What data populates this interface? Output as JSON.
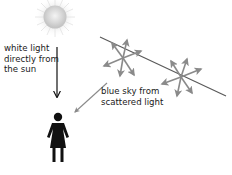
{
  "diagram": {
    "labels": {
      "direct_light": [
        "white light",
        "directly from",
        "the sun"
      ],
      "scattered_light": [
        "blue sky from",
        "scattered light"
      ]
    },
    "elements": {
      "sun": {
        "icon": "sun-icon",
        "cx": 55,
        "cy": 17,
        "r": 12
      },
      "direct_arrow": {
        "from": [
          57,
          47
        ],
        "to": [
          57,
          98
        ],
        "color": "#111111"
      },
      "incoming_ray": {
        "from": [
          100,
          37
        ],
        "to": [
          226,
          96
        ],
        "color": "#555555"
      },
      "scatter_points": [
        {
          "cx": 123,
          "cy": 58
        },
        {
          "cx": 181,
          "cy": 77
        }
      ],
      "scattered_to_observer": {
        "from": [
          107,
          83
        ],
        "to": [
          73,
          113
        ],
        "color": "#888888"
      },
      "observer": {
        "icon": "person-icon",
        "x": 58,
        "y": 133
      }
    },
    "colors": {
      "arrow_gray": "#8a8a8a",
      "line_gray": "#5a5a5a",
      "black": "#111111",
      "sun_core": "#d9d9d9"
    }
  }
}
